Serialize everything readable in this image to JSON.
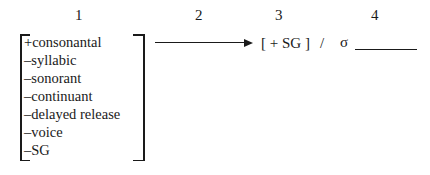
{
  "column_numbers": [
    "1",
    "2",
    "3",
    "4"
  ],
  "feature_matrix": {
    "features": [
      "+consonantal",
      "–syllabic",
      "–sonorant",
      "–continuant",
      "–delayed release",
      "–voice",
      "–SG"
    ]
  },
  "rule": {
    "output": "[ + SG ]",
    "slash": "/",
    "sigma": "σ"
  },
  "icons": {
    "arrow": "right-arrow-icon"
  }
}
